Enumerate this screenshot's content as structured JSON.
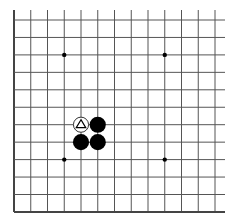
{
  "board": {
    "label": "Go board diagram",
    "origin_x": 14,
    "origin_y": 20,
    "spacing_x": 16.75,
    "spacing_y": 17.45,
    "cols": 13,
    "rows": 12,
    "line_extend_right": 225,
    "line_extend_top": 10,
    "edges": {
      "left": true,
      "bottom": true,
      "top": false,
      "right": false
    },
    "colors": {
      "line": "#555555",
      "edge": "#444444",
      "background": "#ffffff",
      "black_stone": "#000000",
      "white_stone": "#ffffff",
      "white_outline": "#333333"
    },
    "star_points": [
      {
        "col": 3,
        "row": 2
      },
      {
        "col": 9,
        "row": 2
      },
      {
        "col": 3,
        "row": 8
      },
      {
        "col": 9,
        "row": 8
      }
    ],
    "stones": [
      {
        "color": "white",
        "col": 4,
        "row": 6,
        "marker": "triangle"
      },
      {
        "color": "black",
        "col": 5,
        "row": 6,
        "marker": ""
      },
      {
        "color": "black",
        "col": 4,
        "row": 7,
        "marker": ""
      },
      {
        "color": "black",
        "col": 5,
        "row": 7,
        "marker": ""
      }
    ]
  }
}
